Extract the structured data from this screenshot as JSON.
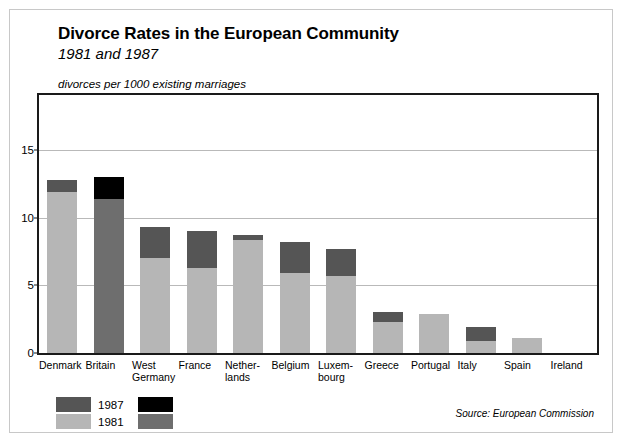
{
  "header": {
    "title": "Divorce Rates in the European Community",
    "subtitle": "1981 and 1987",
    "units": "divorces per 1000 existing marriages"
  },
  "source": "Source: European Commission",
  "legend": {
    "items": [
      {
        "label": "1987",
        "color": "#555555"
      },
      {
        "label": "1981",
        "color": "#b6b6b6"
      }
    ],
    "highlight_items": [
      {
        "label": "",
        "color": "#000000"
      },
      {
        "label": "",
        "color": "#6e6e6e"
      }
    ]
  },
  "colors": {
    "bar_1981": "#b6b6b6",
    "bar_1987": "#555555",
    "bar_1981_highlight": "#6e6e6e",
    "bar_1987_highlight": "#000000",
    "gridline": "#b9b9b9",
    "axis": "#1a1a1a",
    "frame": "#c8c8c8"
  },
  "chart_data": {
    "type": "bar",
    "subtype": "stacked-overlay",
    "title": "Divorce Rates in the European Community",
    "subtitle": "1981 and 1987",
    "xlabel": "",
    "ylabel": "divorces per 1000 existing marriages",
    "ylim": [
      0,
      19.1
    ],
    "yticks": [
      0,
      5,
      10,
      15
    ],
    "ytick_labels": [
      "0",
      "5",
      "10",
      "15"
    ],
    "grid": true,
    "legend_position": "bottom-left",
    "categories": [
      "Denmark",
      "Britain",
      "West\nGermany",
      "France",
      "Nether-\nlands",
      "Belgium",
      "Luxem-\nbourg",
      "Greece",
      "Portugal",
      "Italy",
      "Spain",
      "Ireland"
    ],
    "series": [
      {
        "name": "1981",
        "values": [
          11.9,
          11.4,
          7.0,
          6.3,
          8.4,
          5.9,
          5.7,
          2.3,
          2.9,
          0.9,
          1.1,
          0.0
        ]
      },
      {
        "name": "1987",
        "values": [
          12.8,
          13.0,
          9.3,
          9.0,
          8.7,
          8.2,
          7.7,
          3.0,
          2.9,
          1.9,
          1.1,
          0.0
        ]
      }
    ],
    "highlighted_category": "Britain"
  }
}
